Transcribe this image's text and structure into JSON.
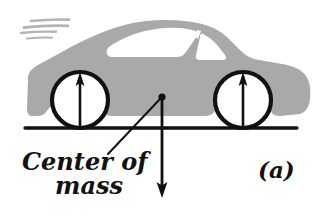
{
  "figure": {
    "panel_label": "(a)",
    "com_label_line1": "Center of",
    "com_label_line2": "mass",
    "colors": {
      "ink": "#111111",
      "car_body_gray": "#a9a9a9",
      "window_white": "#ffffff",
      "speed_line_gray": "#b4b4b4",
      "background": "#ffffff"
    },
    "geometry": {
      "ground_line": {
        "x1": 25,
        "y1": 128,
        "x2": 297,
        "y2": 128,
        "width": 3
      },
      "front_wheel": {
        "cx": 80,
        "cy": 100,
        "r": 28
      },
      "rear_wheel": {
        "cx": 243,
        "cy": 100,
        "r": 28
      },
      "center_of_mass_point": {
        "x": 162,
        "y": 97
      },
      "weight_arrow": {
        "x": 162,
        "y_start": 97,
        "y_end": 196
      },
      "front_normal_arrow": {
        "x": 80,
        "y_start": 125,
        "y_end": 74
      },
      "rear_normal_arrow": {
        "x": 243,
        "y_start": 125,
        "y_end": 74
      },
      "leader_line": {
        "x1": 110,
        "y1": 152,
        "x2": 160,
        "y2": 99
      }
    },
    "elements": {
      "car_silhouette": "gray car side profile, moving left to right",
      "speed_lines_count": 4,
      "arrows": [
        {
          "name": "front-wheel-normal-force",
          "direction": "up"
        },
        {
          "name": "rear-wheel-normal-force",
          "direction": "up"
        },
        {
          "name": "weight-force",
          "direction": "down"
        }
      ]
    }
  }
}
